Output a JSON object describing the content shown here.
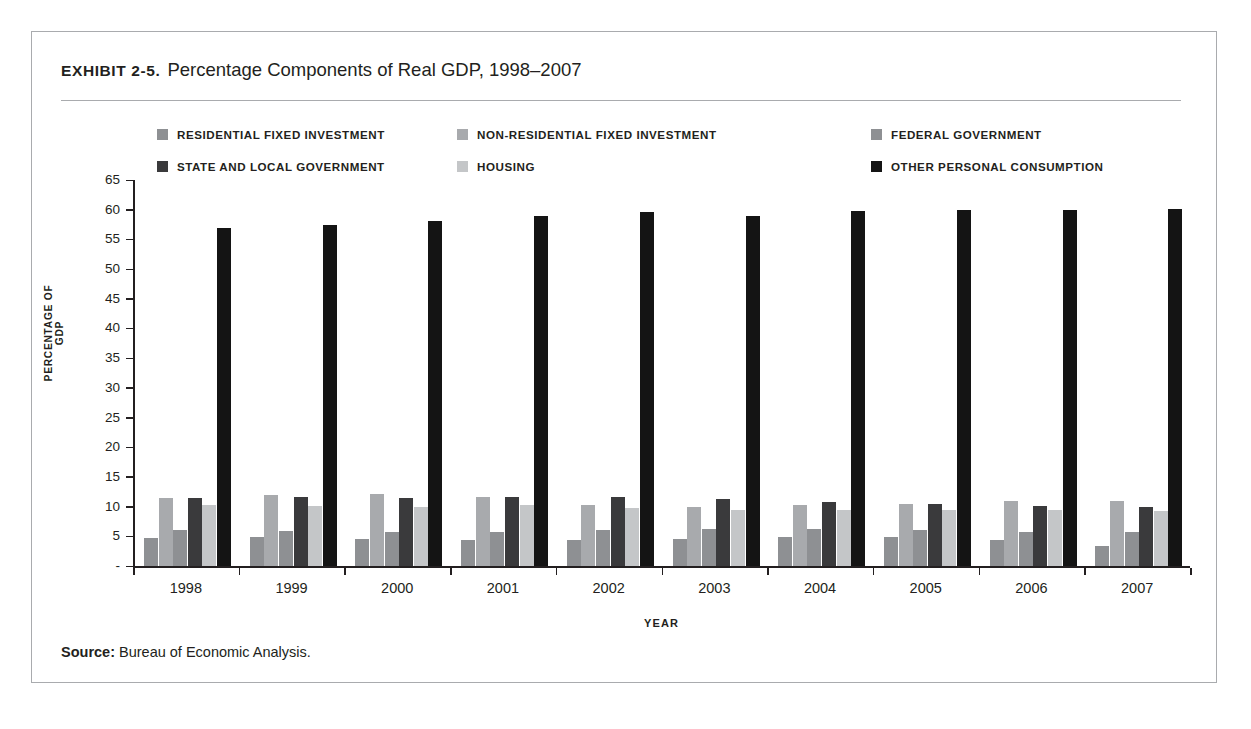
{
  "exhibit": {
    "label": "EXHIBIT 2-5.",
    "title": "Percentage Components of Real GDP, 1998–2007"
  },
  "source": {
    "label": "Source:",
    "text": "Bureau of Economic Analysis."
  },
  "chart_data": {
    "type": "bar",
    "title": "Percentage Components of Real GDP, 1998–2007",
    "subtitle": "",
    "xlabel": "YEAR",
    "ylabel": "PERCENTAGE OF GDP",
    "categories": [
      "1998",
      "1999",
      "2000",
      "2001",
      "2002",
      "2003",
      "2004",
      "2005",
      "2006",
      "2007"
    ],
    "ylim": [
      0,
      65
    ],
    "yticks": [
      0,
      5,
      10,
      15,
      20,
      25,
      30,
      35,
      40,
      45,
      50,
      55,
      60,
      65
    ],
    "ytick_labels": [
      "-",
      "5",
      "10",
      "15",
      "20",
      "25",
      "30",
      "35",
      "40",
      "45",
      "50",
      "55",
      "60",
      "65"
    ],
    "grid": false,
    "legend_position": "top",
    "series": [
      {
        "name": "RESIDENTIAL FIXED INVESTMENT",
        "color": "#8e9093",
        "values": [
          4.7,
          4.8,
          4.5,
          4.3,
          4.4,
          4.6,
          4.8,
          4.8,
          4.3,
          3.4
        ]
      },
      {
        "name": "NON-RESIDENTIAL FIXED INVESTMENT",
        "color": "#a8aaad",
        "values": [
          11.4,
          11.9,
          12.2,
          11.6,
          10.2,
          10.0,
          10.2,
          10.5,
          10.9,
          11.0
        ]
      },
      {
        "name": "FEDERAL GOVERNMENT",
        "color": "#8e9093",
        "values": [
          6.1,
          5.9,
          5.7,
          5.8,
          6.0,
          6.3,
          6.2,
          6.0,
          5.8,
          5.7
        ]
      },
      {
        "name": "STATE AND LOCAL GOVERNMENT",
        "color": "#3a3a3c",
        "values": [
          11.5,
          11.6,
          11.4,
          11.6,
          11.6,
          11.2,
          10.7,
          10.4,
          10.1,
          10.0
        ]
      },
      {
        "name": "HOUSING",
        "color": "#c4c6c8",
        "values": [
          10.3,
          10.1,
          10.0,
          10.2,
          9.8,
          9.5,
          9.5,
          9.4,
          9.4,
          9.2
        ]
      },
      {
        "name": "OTHER PERSONAL CONSUMPTION",
        "color": "#141414",
        "values": [
          57.0,
          57.5,
          58.1,
          59.0,
          59.6,
          58.9,
          59.8,
          59.9,
          59.9,
          60.2
        ]
      }
    ]
  }
}
